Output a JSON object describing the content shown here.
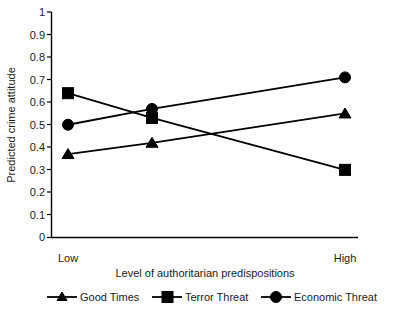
{
  "chart_data": {
    "type": "line",
    "title": "",
    "xlabel": "Level of authoritarian predispositions",
    "ylabel": "Predicted crime attitude",
    "categories": [
      "Low",
      "",
      "High"
    ],
    "tick_labels_x": [
      "Low",
      "High"
    ],
    "ylim": [
      0,
      1
    ],
    "ytick_labels": [
      "0",
      "0.1",
      "0.2",
      "0.3",
      "0.4",
      "0.5",
      "0.6",
      "0.7",
      "0.8",
      "0.9",
      "1"
    ],
    "ytick_values": [
      0,
      0.1,
      0.2,
      0.3,
      0.4,
      0.5,
      0.6,
      0.7,
      0.8,
      0.9,
      1
    ],
    "grid": false,
    "legend_position": "bottom",
    "series": [
      {
        "name": "Good Times",
        "marker": "triangle",
        "color": "#000000",
        "values": [
          0.37,
          0.42,
          0.55
        ]
      },
      {
        "name": "Terror Threat",
        "marker": "square",
        "color": "#000000",
        "values": [
          0.64,
          0.53,
          0.3
        ]
      },
      {
        "name": "Economic Threat",
        "marker": "circle",
        "color": "#000000",
        "values": [
          0.5,
          0.57,
          0.71
        ]
      }
    ]
  },
  "axes": {
    "y_title": "Predicted crime attitude",
    "x_title": "Level of authoritarian predispositions",
    "y_ticks": [
      {
        "label": "1",
        "value": 1
      },
      {
        "label": "0.9",
        "value": 0.9
      },
      {
        "label": "0.8",
        "value": 0.8
      },
      {
        "label": "0.7",
        "value": 0.7
      },
      {
        "label": "0.6",
        "value": 0.6
      },
      {
        "label": "0.5",
        "value": 0.5
      },
      {
        "label": "0.4",
        "value": 0.4
      },
      {
        "label": "0.3",
        "value": 0.3
      },
      {
        "label": "0.2",
        "value": 0.2
      },
      {
        "label": "0.1",
        "value": 0.1
      },
      {
        "label": "0",
        "value": 0
      }
    ],
    "x_ticks": [
      {
        "label": "Low"
      },
      {
        "label": "High"
      }
    ]
  },
  "legend": {
    "items": [
      {
        "label": "Good Times",
        "marker": "triangle"
      },
      {
        "label": "Terror Threat",
        "marker": "square"
      },
      {
        "label": "Economic Threat",
        "marker": "circle"
      }
    ]
  }
}
